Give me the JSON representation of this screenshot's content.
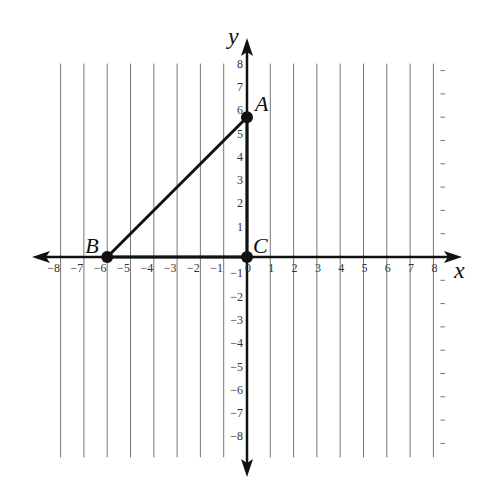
{
  "chart_data": {
    "type": "scatter",
    "title": "",
    "xlabel": "x",
    "ylabel": "y",
    "xlim": [
      -8,
      8
    ],
    "ylim": [
      -8,
      8
    ],
    "grid": true,
    "x_ticks": [
      -8,
      -7,
      -6,
      -5,
      -4,
      -3,
      -2,
      -1,
      0,
      1,
      2,
      3,
      4,
      5,
      6,
      7,
      8
    ],
    "y_ticks": [
      -8,
      -7,
      -6,
      -5,
      -4,
      -3,
      -2,
      -1,
      1,
      2,
      3,
      4,
      5,
      6,
      7,
      8
    ],
    "points": [
      {
        "label": "A",
        "x": 0,
        "y": 6
      },
      {
        "label": "B",
        "x": -6,
        "y": 0
      },
      {
        "label": "C",
        "x": 0,
        "y": 0
      }
    ],
    "segments": [
      {
        "from": "A",
        "to": "B"
      },
      {
        "from": "B",
        "to": "C"
      },
      {
        "from": "C",
        "to": "A"
      }
    ],
    "shape": "triangle ABC"
  },
  "layout": {
    "origin_px": [
      247,
      257
    ],
    "unit_px": 23.3,
    "grid_extent": {
      "left": -8.5,
      "right": 8.3,
      "top": 8.3,
      "bottom": 8.6
    },
    "colors": {
      "grid": "#777777",
      "axis": "#111111",
      "shape": "#111111",
      "tick": "#333333"
    }
  }
}
